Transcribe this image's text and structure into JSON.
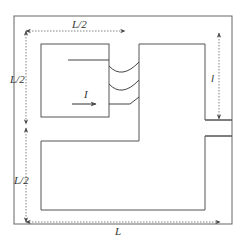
{
  "figure": {
    "type": "magnetic-core-diagram",
    "labels": {
      "top_width": "L/2",
      "left_upper_height": "L/2",
      "left_lower_height": "L/2",
      "bottom_width": "L",
      "gap_length": "l",
      "current": "I"
    },
    "colors": {
      "core_line": "#555555",
      "dimension_line": "#777777",
      "text": "#333333",
      "background": "#ffffff"
    }
  }
}
